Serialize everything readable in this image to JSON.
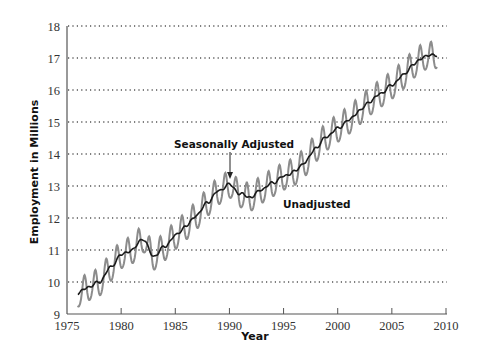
{
  "chart_data": {
    "type": "line",
    "title": "",
    "xlabel": "Year",
    "ylabel": "Employment in Millions",
    "xlim": [
      1975,
      2010
    ],
    "ylim": [
      9,
      18
    ],
    "x_ticks": [
      "1975",
      "1980",
      "1985",
      "1990",
      "1995",
      "2000",
      "2005",
      "2010"
    ],
    "y_ticks": [
      "9",
      "10",
      "11",
      "12",
      "13",
      "14",
      "15",
      "16",
      "17",
      "18"
    ],
    "grid": {
      "horizontal": true,
      "style": "dotted",
      "vertical": false
    },
    "legend": null,
    "annotations": [
      {
        "text": "Seasonally Adjusted",
        "x": 1990.2,
        "y": 13.05,
        "arrow": true
      },
      {
        "text": "Unadjusted",
        "x": 1995.5,
        "y": 12.5,
        "arrow": false
      }
    ],
    "x": [
      1976,
      1977,
      1978,
      1979,
      1980,
      1981,
      1982,
      1983,
      1984,
      1985,
      1986,
      1987,
      1988,
      1989,
      1990,
      1991,
      1992,
      1993,
      1994,
      1995,
      1996,
      1997,
      1998,
      1999,
      2000,
      2001,
      2002,
      2003,
      2004,
      2005,
      2006,
      2007,
      2008,
      2009
    ],
    "series": [
      {
        "name": "Seasonally Adjusted",
        "color": "#1a1a1a",
        "values": [
          9.65,
          9.85,
          10.0,
          10.45,
          10.85,
          11.0,
          11.35,
          10.8,
          11.1,
          11.45,
          11.75,
          12.1,
          12.5,
          12.85,
          13.05,
          12.75,
          12.65,
          12.9,
          13.1,
          13.3,
          13.45,
          13.75,
          14.2,
          14.55,
          14.8,
          15.05,
          15.35,
          15.65,
          15.9,
          16.15,
          16.45,
          16.8,
          17.05,
          17.1
        ]
      },
      {
        "name": "Unadjusted",
        "color": "#8c8c8c",
        "seasonal_amplitude": 0.42,
        "values": [
          9.65,
          9.85,
          10.0,
          10.45,
          10.85,
          11.0,
          11.35,
          10.8,
          11.1,
          11.45,
          11.75,
          12.1,
          12.5,
          12.85,
          13.05,
          12.75,
          12.65,
          12.9,
          13.1,
          13.3,
          13.45,
          13.75,
          14.2,
          14.55,
          14.8,
          15.05,
          15.35,
          15.65,
          15.9,
          16.15,
          16.45,
          16.8,
          17.05,
          17.1
        ]
      }
    ]
  }
}
